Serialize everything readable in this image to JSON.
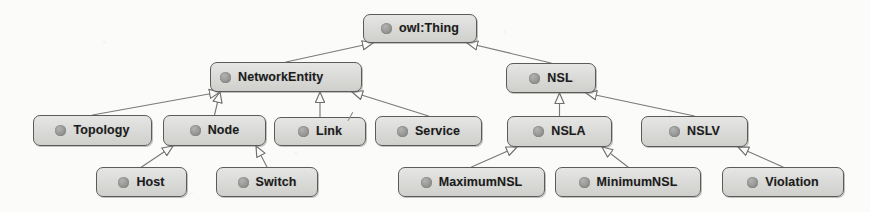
{
  "diagram": {
    "type": "class-hierarchy-tree",
    "notation": "UML generalization (hollow triangle arrowhead points to superclass)",
    "root": "owl:Thing",
    "style": {
      "canvas_background": "#fbfbfa",
      "node_fill": "#dcdcda",
      "node_border": "#5b5b5b",
      "node_text": "#1c1c1c",
      "bullet_color": "#979795",
      "edge_color": "#7a7a78"
    },
    "nodes": [
      {
        "id": "owlthing",
        "label": "owl:Thing",
        "x": 363,
        "y": 14,
        "w": 114,
        "h": 29,
        "level": 0,
        "icon": "class-bullet-icon",
        "centered": true
      },
      {
        "id": "networkentity",
        "label": "NetworkEntity",
        "x": 210,
        "y": 62,
        "w": 152,
        "h": 30,
        "level": 1,
        "icon": "class-bullet-icon",
        "centered": false
      },
      {
        "id": "nsl",
        "label": "NSL",
        "x": 506,
        "y": 63,
        "w": 90,
        "h": 30,
        "level": 1,
        "icon": "class-bullet-icon",
        "centered": true
      },
      {
        "id": "topology",
        "label": "Topology",
        "x": 33,
        "y": 115,
        "w": 119,
        "h": 31,
        "level": 2,
        "icon": "class-bullet-icon",
        "centered": true
      },
      {
        "id": "node",
        "label": "Node",
        "x": 163,
        "y": 115,
        "w": 103,
        "h": 31,
        "level": 2,
        "icon": "class-bullet-icon",
        "centered": true
      },
      {
        "id": "link",
        "label": "Link",
        "x": 274,
        "y": 117,
        "w": 92,
        "h": 29,
        "level": 2,
        "icon": "class-bullet-icon",
        "centered": true
      },
      {
        "id": "service",
        "label": "Service",
        "x": 375,
        "y": 116,
        "w": 107,
        "h": 30,
        "level": 2,
        "icon": "class-bullet-icon",
        "centered": true
      },
      {
        "id": "nsla",
        "label": "NSLA",
        "x": 507,
        "y": 116,
        "w": 105,
        "h": 31,
        "level": 2,
        "icon": "class-bullet-icon",
        "centered": true
      },
      {
        "id": "nslv",
        "label": "NSLV",
        "x": 641,
        "y": 116,
        "w": 107,
        "h": 31,
        "level": 2,
        "icon": "class-bullet-icon",
        "centered": true
      },
      {
        "id": "host",
        "label": "Host",
        "x": 96,
        "y": 167,
        "w": 91,
        "h": 30,
        "level": 3,
        "icon": "class-bullet-icon",
        "centered": true
      },
      {
        "id": "switch",
        "label": "Switch",
        "x": 216,
        "y": 167,
        "w": 102,
        "h": 30,
        "level": 3,
        "icon": "class-bullet-icon",
        "centered": true
      },
      {
        "id": "maximumnsl",
        "label": "MaximumNSL",
        "x": 398,
        "y": 167,
        "w": 147,
        "h": 30,
        "level": 3,
        "icon": "class-bullet-icon",
        "centered": true
      },
      {
        "id": "minimumnsl",
        "label": "MinimumNSL",
        "x": 555,
        "y": 167,
        "w": 146,
        "h": 30,
        "level": 3,
        "icon": "class-bullet-icon",
        "centered": true
      },
      {
        "id": "violation",
        "label": "Violation",
        "x": 722,
        "y": 167,
        "w": 122,
        "h": 30,
        "level": 3,
        "icon": "class-bullet-icon",
        "centered": true
      }
    ],
    "edges": [
      {
        "from": "networkentity",
        "to": "owlthing",
        "relation": "subClassOf"
      },
      {
        "from": "nsl",
        "to": "owlthing",
        "relation": "subClassOf"
      },
      {
        "from": "topology",
        "to": "networkentity",
        "relation": "subClassOf"
      },
      {
        "from": "node",
        "to": "networkentity",
        "relation": "subClassOf"
      },
      {
        "from": "link",
        "to": "networkentity",
        "relation": "subClassOf"
      },
      {
        "from": "service",
        "to": "networkentity",
        "relation": "subClassOf"
      },
      {
        "from": "nsla",
        "to": "nsl",
        "relation": "subClassOf"
      },
      {
        "from": "nslv",
        "to": "nsl",
        "relation": "subClassOf"
      },
      {
        "from": "host",
        "to": "node",
        "relation": "subClassOf"
      },
      {
        "from": "switch",
        "to": "node",
        "relation": "subClassOf"
      },
      {
        "from": "maximumnsl",
        "to": "nsla",
        "relation": "subClassOf"
      },
      {
        "from": "minimumnsl",
        "to": "nsla",
        "relation": "subClassOf"
      },
      {
        "from": "violation",
        "to": "nslv",
        "relation": "subClassOf"
      }
    ],
    "artifacts": [
      {
        "id": "stray-mark",
        "x": 347,
        "y": 112,
        "note": "scan speck"
      }
    ]
  }
}
